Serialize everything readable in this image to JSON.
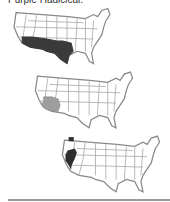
{
  "title": "Purple Hadicicai.",
  "maps": [
    {
      "label": "range-map-1",
      "highlight": "southwest-border (S. California, Arizona, New Mexico, Texas)",
      "fill": "#3a3a3a"
    },
    {
      "label": "range-map-2",
      "highlight": "S. Nevada, S. California, W. Arizona",
      "fill": "#9e9e9e"
    },
    {
      "label": "range-map-3",
      "highlight": "N. California, W. Washington spot",
      "fill": "#2e2e2e"
    }
  ],
  "colors": {
    "outline": "#888888",
    "state_lines": "#aaaaaa",
    "rule": "#9a9a9a"
  }
}
